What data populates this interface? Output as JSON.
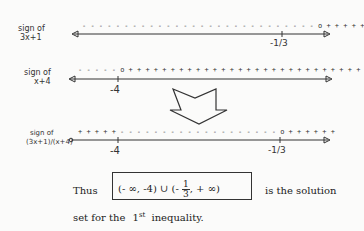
{
  "rows": [
    {
      "label_line1": "sign of",
      "label_line2": "3x+1",
      "signs": "- - - - - - - - - - - - - - - - - - - - - - - - - - - - o + + + + +",
      "tick_label": "-1/3",
      "critical_point": "-1/3"
    },
    {
      "label_line1": "sign of",
      "label_line2": "x+4",
      "signs": "- - - - - o + + + + + + + + + + + + + + + + + + + + + + + + + + + +",
      "tick_label": "-4",
      "critical_point": "-4"
    },
    {
      "label_line1": "sign of",
      "label_line2": "(3x+1)/(x+4)",
      "signs_left": "+ + + + +",
      "signs_right": "- - - - - - - - - - - - - - - - - - - o + + + + + +",
      "tick_labels": [
        "-4",
        "-1/3"
      ]
    }
  ],
  "arrow_icon": "down-arrow",
  "conclusion": {
    "prefix": "Thus",
    "interval_part1": "(- ∞, -4) ∪ (-",
    "frac_num": "1",
    "frac_den": "3",
    "interval_part2": ", + ∞)",
    "suffix": "is the solution",
    "line2_prefix": "set for the",
    "ordinal_num": "1",
    "ordinal_sup": "st",
    "line2_suffix": "inequality."
  }
}
